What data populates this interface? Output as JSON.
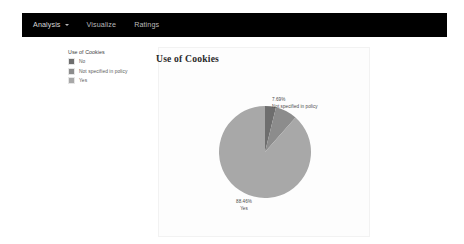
{
  "navbar": {
    "items": [
      {
        "label": "Analysis",
        "has_caret": true,
        "active": true
      },
      {
        "label": "Visualize",
        "has_caret": false,
        "active": false
      },
      {
        "label": "Ratings",
        "has_caret": false,
        "active": false
      }
    ]
  },
  "legend": {
    "title": "Use of Cookies",
    "items": [
      {
        "label": "No",
        "color": "#6e6e6e"
      },
      {
        "label": "Not specified in policy",
        "color": "#8c8c8c"
      },
      {
        "label": "Yes",
        "color": "#a8a8a8"
      }
    ]
  },
  "chart_data": {
    "type": "pie",
    "title": "Use of Cookies",
    "legend_title": "Use of Cookies",
    "legend_position": "left",
    "categories": [
      "No",
      "Not specified in policy",
      "Yes"
    ],
    "values": [
      3.85,
      7.69,
      88.46
    ],
    "value_unit": "%",
    "colors": [
      "#6e6e6e",
      "#8c8c8c",
      "#a8a8a8"
    ],
    "labels": [
      {
        "category": "No",
        "percent": "",
        "shown": false
      },
      {
        "category": "Not specified in policy",
        "percent": "7.69%",
        "shown": true
      },
      {
        "category": "Yes",
        "percent": "88.46%",
        "shown": true
      }
    ],
    "start_angle_deg": 0,
    "direction": "clockwise"
  },
  "pie_labels": {
    "notspecified": {
      "percent": "7.69%",
      "name": "Not specified in policy"
    },
    "yes": {
      "percent": "88.46%",
      "name": "Yes"
    }
  }
}
